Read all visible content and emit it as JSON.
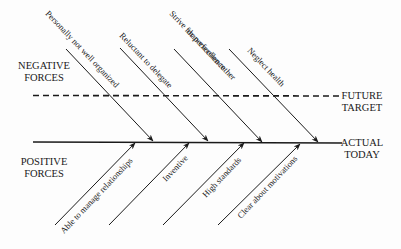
{
  "diagram": {
    "type": "force-field-analysis",
    "left_labels": {
      "negative": [
        "NEGATIVE",
        "FORCES"
      ],
      "positive": [
        "POSITIVE",
        "FORCES"
      ]
    },
    "right_labels": {
      "future": [
        "FUTURE",
        "TARGET"
      ],
      "actual": [
        "ACTUAL",
        "TODAY"
      ]
    },
    "lines": {
      "future_target": {
        "style": "dashed",
        "x1": 33,
        "y1": 95,
        "x2": 340,
        "y2": 96
      },
      "actual_today": {
        "style": "solid",
        "x1": 33,
        "y1": 142,
        "x2": 342,
        "y2": 143
      }
    },
    "negative_forces": [
      {
        "label": "Personally not well organized",
        "lines": [
          "Personally not well organized"
        ]
      },
      {
        "label": "Reluctant to delegate",
        "lines": [
          "Reluctant to delegate"
        ]
      },
      {
        "label": "Strive for perfection rather than excellence",
        "lines": [
          "Strive for perfection rather",
          "than excellence"
        ]
      },
      {
        "label": "Neglect health",
        "lines": [
          "Neglect health"
        ]
      }
    ],
    "positive_forces": [
      {
        "label": "Able to manage relationships"
      },
      {
        "label": "Inventive"
      },
      {
        "label": "High standards"
      },
      {
        "label": "Clear about motivations"
      }
    ],
    "colors": {
      "ink": "#1a1a1a",
      "background": "#fdfdfd"
    }
  }
}
